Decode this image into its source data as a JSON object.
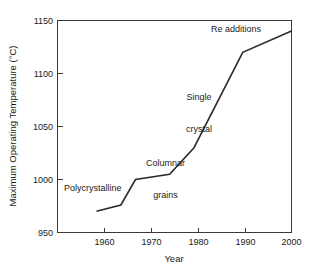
{
  "chart_data": {
    "type": "line",
    "title": "",
    "xlabel": "Year",
    "ylabel": "Maximum Operating Temperature (°C)",
    "xlim": [
      1952,
      2000
    ],
    "ylim": [
      950,
      1150
    ],
    "xticks": [
      1960,
      1970,
      1980,
      1990,
      2000
    ],
    "xtick_labels": [
      "1960",
      "1970",
      "1980",
      "1990",
      "2000"
    ],
    "yticks": [
      950,
      1000,
      1050,
      1100,
      1150
    ],
    "ytick_labels": [
      "950",
      "1000",
      "1050",
      "1100",
      "1150"
    ],
    "grid": false,
    "legend": false,
    "series": [
      {
        "name": "Maximum operating temperature",
        "x": [
          1960,
          1965,
          1968,
          1975,
          1980,
          1990,
          2000
        ],
        "values": [
          970,
          976,
          1000,
          1005,
          1030,
          1120,
          1140
        ]
      }
    ],
    "annotations": [
      {
        "text": "Polycrystalline",
        "x": 1962,
        "y": 985
      },
      {
        "text": "Columnar\ngrains",
        "x": 1972,
        "y": 1038
      },
      {
        "text": "Single\ncrystal",
        "x": 1981,
        "y": 1085
      },
      {
        "text": "Re additions",
        "x": 1987,
        "y": 1138
      }
    ]
  },
  "annotations": {
    "polycrystalline": "Polycrystalline",
    "columnar_line1": "Columnar",
    "columnar_line2": "grains",
    "single_line1": "Single",
    "single_line2": "crystal",
    "re_additions": "Re additions"
  },
  "axes": {
    "x_title": "Year",
    "y_title": "Maximum Operating Temperature (°C)",
    "x_tick_1": "1960",
    "x_tick_2": "1970",
    "x_tick_3": "1980",
    "x_tick_4": "1990",
    "x_tick_5": "2000",
    "y_tick_1": "950",
    "y_tick_2": "1000",
    "y_tick_3": "1050",
    "y_tick_4": "1100",
    "y_tick_5": "1150"
  },
  "colors": {
    "line": "#2b2b2b",
    "axis": "#3a3a3a",
    "background": "#ffffff",
    "text": "#1a1a1a"
  }
}
